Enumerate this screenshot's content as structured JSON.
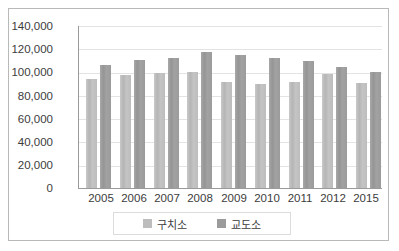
{
  "chart_data": {
    "type": "bar",
    "title": "",
    "xlabel": "",
    "ylabel": "",
    "ylim": [
      0,
      140000
    ],
    "ytick_step": 20000,
    "grid": true,
    "legend_position": "bottom",
    "categories": [
      "2005",
      "2006",
      "2007",
      "2008",
      "2009",
      "2010",
      "2011",
      "2012",
      "2015"
    ],
    "ytick_labels": [
      "140,000",
      "120,000",
      "100,000",
      "80,000",
      "60,000",
      "40,000",
      "20,000",
      "0"
    ],
    "ytick_values": [
      140000,
      120000,
      100000,
      80000,
      60000,
      40000,
      20000,
      0
    ],
    "series": [
      {
        "name": "구치소",
        "color": "#bdbdbd",
        "values": [
          94000,
          97000,
          99000,
          100000,
          91000,
          89000,
          91000,
          98000,
          90000
        ]
      },
      {
        "name": "교도소",
        "color": "#9b9b9b",
        "values": [
          106000,
          110000,
          112000,
          117000,
          114000,
          112000,
          109000,
          104000,
          100000
        ]
      }
    ]
  },
  "legend": {
    "items": [
      {
        "label": "구치소",
        "swatch": "series-1-swatch"
      },
      {
        "label": "교도소",
        "swatch": "series-2-swatch"
      }
    ]
  }
}
